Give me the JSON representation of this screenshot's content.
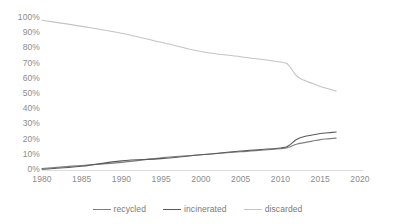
{
  "chart_data": {
    "type": "line",
    "title": "",
    "subtitle": "",
    "xlabel": "",
    "ylabel": "",
    "xlim": [
      1980,
      2020
    ],
    "ylim": [
      0,
      100
    ],
    "grid": false,
    "legend_position": "bottom",
    "x_ticks": [
      "1980",
      "1985",
      "1990",
      "1995",
      "2000",
      "2005",
      "2010",
      "2015",
      "2020"
    ],
    "y_ticks": [
      "100%",
      "90%",
      "80%",
      "70%",
      "60%",
      "50%",
      "40%",
      "30%",
      "20%",
      "10%",
      "0%"
    ],
    "x": [
      1980,
      1985,
      1990,
      1995,
      2000,
      2005,
      2010,
      2011,
      2012,
      2013,
      2014,
      2015,
      2016,
      2017
    ],
    "series": [
      {
        "name": "recycled",
        "color": "#7f7f7f",
        "values": [
          1,
          3,
          5,
          8,
          10,
          12,
          14,
          15,
          17,
          18,
          19,
          20,
          20.5,
          21
        ]
      },
      {
        "name": "incinerated",
        "color": "#5a5a5a",
        "values": [
          0.5,
          2.5,
          6,
          7.5,
          10,
          12.5,
          14.5,
          16,
          20,
          22,
          23,
          24,
          24.5,
          25
        ]
      },
      {
        "name": "discarded",
        "color": "#c4c4c4",
        "values": [
          98.5,
          94.5,
          90,
          84,
          78,
          74.5,
          71,
          69,
          62,
          59,
          57,
          55,
          53.5,
          52
        ]
      }
    ]
  },
  "legend": {
    "items": [
      {
        "label": "recycled",
        "color": "#7f7f7f"
      },
      {
        "label": "incinerated",
        "color": "#5a5a5a"
      },
      {
        "label": "discarded",
        "color": "#c4c4c4"
      }
    ]
  },
  "axes": {
    "y_tick_labels": [
      "100%",
      "90%",
      "80%",
      "70%",
      "60%",
      "50%",
      "40%",
      "30%",
      "20%",
      "10%",
      "0%"
    ],
    "x_tick_labels": [
      "1980",
      "1985",
      "1990",
      "1995",
      "2000",
      "2005",
      "2010",
      "2015",
      "2020"
    ]
  },
  "colors": {
    "axis_text": "#8c8c8c",
    "axis_line": "#d0d0d0",
    "background": "#ffffff"
  }
}
